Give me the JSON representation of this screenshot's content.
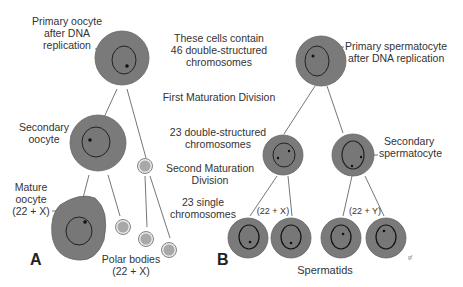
{
  "panel_a": {
    "letter": "A",
    "primary_oocyte": [
      "Primary oocyte",
      "after DNA",
      "replication"
    ],
    "secondary_oocyte": [
      "Secondary",
      "oocyte"
    ],
    "mature_oocyte": [
      "Mature",
      "oocyte",
      "(22 + X)"
    ],
    "polar_bodies": [
      "Polar bodies",
      "(22 + X)"
    ]
  },
  "middle": {
    "cells_contain": [
      "These cells contain",
      "46 double-structured",
      "chromosomes"
    ],
    "first_division": "First Maturation Division",
    "double_23": [
      "23 double-structured",
      "chromosomes"
    ],
    "second_division": [
      "Second Maturation",
      "Division"
    ],
    "single_23": [
      "23 single",
      "chromosomes"
    ]
  },
  "panel_b": {
    "letter": "B",
    "primary_spermatocyte": [
      "Primary spermatocyte",
      "after DNA replication"
    ],
    "secondary_spermatocyte": [
      "Secondary",
      "spermatocyte"
    ],
    "left_pair_label": "(22 + X)",
    "right_pair_label": "(22 + Y)",
    "spermatids": "Spermatids",
    "artist_mark": "gf"
  },
  "colors": {
    "cytoplasm": "#7a7a7a",
    "nucleus_outline": "#1a1a1a",
    "polar_body": "#a8a8a8",
    "line": "#555555",
    "text": "#333333"
  }
}
